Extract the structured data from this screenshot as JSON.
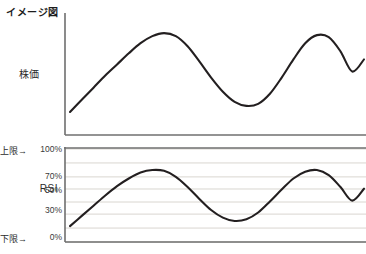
{
  "title": "イメージ図",
  "panels": {
    "price": {
      "label": "株価",
      "axis_color": "#6f6f6f",
      "line_color": "#231f20"
    },
    "rsi": {
      "label": "RSI",
      "upper_limit_label": "上限→",
      "lower_limit_label": "下限→",
      "axis_color": "#6f6f6f",
      "grid_color": "#d9d6d0",
      "line_color": "#231f20",
      "ticks": [
        "100%",
        "70%",
        "50%",
        "30%",
        "0%"
      ]
    }
  },
  "chart_data": [
    {
      "type": "line",
      "title": "株価",
      "xlabel": "",
      "ylabel": "株価",
      "ylim": [
        0,
        100
      ],
      "grid": false,
      "legend": "none",
      "x": [
        0,
        4,
        8,
        12,
        16,
        20,
        24,
        28,
        32,
        36,
        40,
        44,
        48,
        52,
        56,
        60,
        64,
        68,
        72,
        76,
        80,
        84,
        88,
        92,
        96,
        100
      ],
      "series": [
        {
          "name": "株価",
          "values": [
            10,
            22,
            34,
            46,
            57,
            68,
            78,
            85,
            88,
            85,
            75,
            60,
            44,
            30,
            20,
            16,
            18,
            28,
            44,
            62,
            78,
            86,
            84,
            70,
            50,
            62
          ]
        }
      ]
    },
    {
      "type": "line",
      "title": "RSI",
      "xlabel": "",
      "ylabel": "RSI",
      "ylim": [
        0,
        100
      ],
      "grid": true,
      "legend": "none",
      "yticks": [
        0,
        30,
        50,
        70,
        100
      ],
      "ytick_labels": [
        "0%",
        "30%",
        "50%",
        "70%",
        "100%"
      ],
      "annotations": [
        {
          "text": "上限→",
          "value": 100
        },
        {
          "text": "下限→",
          "value": 0
        }
      ],
      "x": [
        0,
        4,
        8,
        12,
        16,
        20,
        24,
        28,
        32,
        36,
        40,
        44,
        48,
        52,
        56,
        60,
        64,
        68,
        72,
        76,
        80,
        84,
        88,
        92,
        96,
        100
      ],
      "series": [
        {
          "name": "RSI",
          "values": [
            14,
            26,
            38,
            50,
            61,
            70,
            77,
            80,
            79,
            72,
            60,
            46,
            33,
            24,
            20,
            22,
            30,
            43,
            57,
            70,
            78,
            80,
            74,
            60,
            44,
            58
          ]
        }
      ]
    }
  ]
}
